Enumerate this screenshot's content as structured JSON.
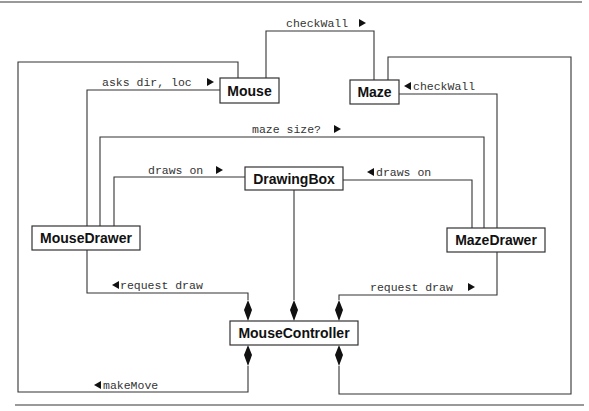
{
  "classes": {
    "mouse": "Mouse",
    "maze": "Maze",
    "drawing_box": "DrawingBox",
    "mouse_drawer": "MouseDrawer",
    "maze_drawer": "MazeDrawer",
    "mouse_controller": "MouseController"
  },
  "messages": {
    "check_wall_top": "checkWall",
    "check_wall_right": "checkWall",
    "asks_dir_loc": "asks dir, loc",
    "maze_size": "maze size?",
    "draws_on_left": "draws on",
    "draws_on_right": "draws on",
    "request_draw_left": "request draw",
    "request_draw_right": "request draw",
    "make_move": "makeMove"
  },
  "relationships": [
    {
      "from": "Mouse",
      "to": "Maze",
      "label": "checkWall",
      "direction": "right"
    },
    {
      "from": "MazeDrawer",
      "to": "Maze",
      "label": "checkWall",
      "direction": "left"
    },
    {
      "from": "MouseDrawer",
      "to": "Mouse",
      "label": "asks dir, loc",
      "direction": "right"
    },
    {
      "from": "MouseDrawer",
      "to": "MazeDrawer",
      "label": "maze size?",
      "direction": "right"
    },
    {
      "from": "MouseDrawer",
      "to": "DrawingBox",
      "label": "draws on",
      "direction": "right"
    },
    {
      "from": "MazeDrawer",
      "to": "DrawingBox",
      "label": "draws on",
      "direction": "left"
    },
    {
      "from": "MouseController",
      "to": "MouseDrawer",
      "label": "request draw",
      "direction": "left",
      "type": "composition"
    },
    {
      "from": "MouseController",
      "to": "MazeDrawer",
      "label": "request draw",
      "direction": "right",
      "type": "composition"
    },
    {
      "from": "MouseController",
      "to": "DrawingBox",
      "label": "",
      "type": "composition"
    },
    {
      "from": "MouseController",
      "to": "Mouse",
      "label": "makeMove",
      "direction": "left",
      "type": "composition"
    },
    {
      "from": "MouseController",
      "to": "Maze",
      "label": "",
      "type": "composition"
    }
  ]
}
